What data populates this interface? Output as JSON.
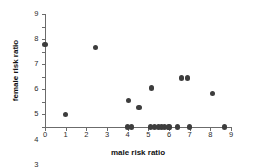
{
  "chart_data": {
    "type": "scatter",
    "title": "",
    "xlabel": "male risk ratio",
    "ylabel": "female risk ratio",
    "xlim": [
      0,
      9
    ],
    "ylim": [
      0,
      9
    ],
    "xticks": [
      0,
      1,
      2,
      3,
      4,
      5,
      6,
      7,
      8,
      9
    ],
    "yticks": [
      0,
      1,
      2,
      3,
      4,
      5,
      6,
      7,
      8,
      9
    ],
    "grid": false,
    "legend": null,
    "marker_color": "#3d3d3d",
    "axis_color": "#6b6b6b",
    "points": [
      {
        "x": 0.0,
        "y": 6.6
      },
      {
        "x": 1.0,
        "y": 1.0
      },
      {
        "x": 2.45,
        "y": 6.3
      },
      {
        "x": 4.05,
        "y": 2.1
      },
      {
        "x": 4.55,
        "y": 1.55
      },
      {
        "x": 5.15,
        "y": 3.1
      },
      {
        "x": 6.6,
        "y": 3.9
      },
      {
        "x": 6.9,
        "y": 3.9
      },
      {
        "x": 8.1,
        "y": 2.7
      },
      {
        "x": 4.0,
        "y": 0.0
      },
      {
        "x": 4.2,
        "y": 0.0
      },
      {
        "x": 5.1,
        "y": 0.0
      },
      {
        "x": 5.3,
        "y": 0.0
      },
      {
        "x": 5.5,
        "y": 0.0
      },
      {
        "x": 5.65,
        "y": 0.0
      },
      {
        "x": 5.8,
        "y": 0.0
      },
      {
        "x": 6.0,
        "y": 0.0
      },
      {
        "x": 6.4,
        "y": 0.0
      },
      {
        "x": 7.0,
        "y": 0.0
      },
      {
        "x": 8.7,
        "y": 0.0
      }
    ]
  }
}
